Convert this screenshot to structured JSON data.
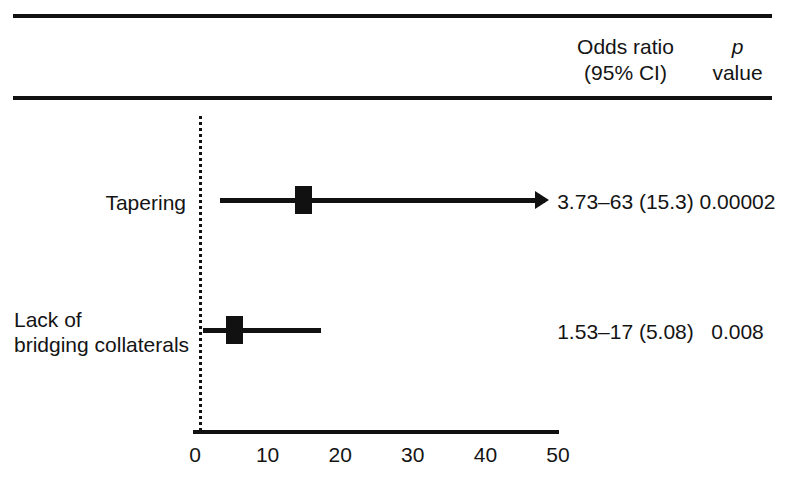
{
  "header": {
    "odds_ratio_line1": "Odds ratio",
    "odds_ratio_line2": "(95% CI)",
    "p_line1": "p",
    "p_line2": "value"
  },
  "chart_data": {
    "type": "table",
    "plot_kind": "forest-plot",
    "title": "",
    "xlabel": "",
    "ylabel": "",
    "xlim": [
      0,
      50
    ],
    "xticks": [
      0,
      10,
      20,
      30,
      40,
      50
    ],
    "xtick_labels": [
      "0",
      "10",
      "20",
      "30",
      "40",
      "50"
    ],
    "grid": false,
    "reference_line": {
      "x": 0,
      "style": "dotted"
    },
    "columns": [
      "",
      "Odds ratio (95% CI)",
      "p value"
    ],
    "rows": [
      {
        "label": "Tapering",
        "odds_ratio": 15.3,
        "ci_low": 3.73,
        "ci_high": 63,
        "ci_truncated_right": true,
        "odds_ratio_text": "3.73‒63 (15.3)",
        "p_value_text": "0.00002"
      },
      {
        "label": "Lack of\nbridging collaterals",
        "odds_ratio": 5.08,
        "ci_low": 1.53,
        "ci_high": 17,
        "ci_truncated_right": false,
        "odds_ratio_text": "1.53‒17 (5.08)",
        "p_value_text": "0.008"
      }
    ]
  },
  "colors": {
    "ink": "#111111",
    "background": "#ffffff"
  }
}
